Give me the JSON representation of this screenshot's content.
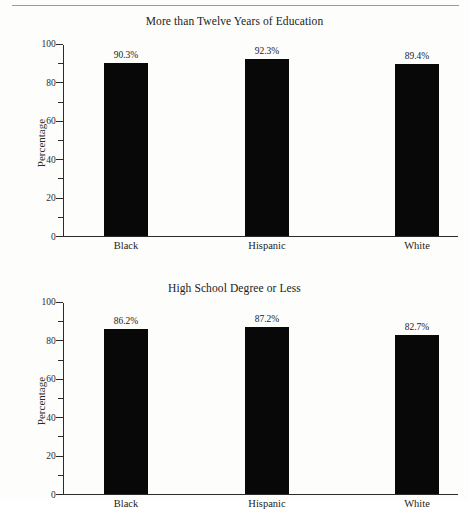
{
  "page": {
    "has_top_rule": true,
    "background_color": "#fdfdfc",
    "bar_color": "#080808",
    "axis_color": "#2b2b2b"
  },
  "chart_data": [
    {
      "id": "more-than-twelve-years-of-education",
      "type": "bar",
      "title": "More than Twelve Years of Education",
      "xlabel": "",
      "ylabel": "Percentage",
      "ylim": [
        0,
        100
      ],
      "yticks": [
        0,
        20,
        40,
        60,
        80,
        100
      ],
      "ytick_labels": [
        "0",
        "20",
        "40",
        "60",
        "80",
        "100"
      ],
      "minor_tick_interval": 10,
      "grid": false,
      "legend": "none",
      "categories": [
        "Black",
        "Hispanic",
        "White"
      ],
      "values": [
        90.3,
        92.3,
        89.4
      ],
      "value_labels": [
        "90.3%",
        "92.3%",
        "89.4%"
      ]
    },
    {
      "id": "high-school-degree-or-less",
      "type": "bar",
      "title": "High School Degree or Less",
      "xlabel": "",
      "ylabel": "Percentage",
      "ylim": [
        0,
        100
      ],
      "yticks": [
        0,
        20,
        40,
        60,
        80,
        100
      ],
      "ytick_labels": [
        "0",
        "20",
        "40",
        "60",
        "80",
        "100"
      ],
      "minor_tick_interval": 10,
      "grid": false,
      "legend": "none",
      "categories": [
        "Black",
        "Hispanic",
        "White"
      ],
      "values": [
        86.2,
        87.2,
        82.7
      ],
      "value_labels": [
        "86.2%",
        "87.2%",
        "82.7%"
      ]
    }
  ]
}
